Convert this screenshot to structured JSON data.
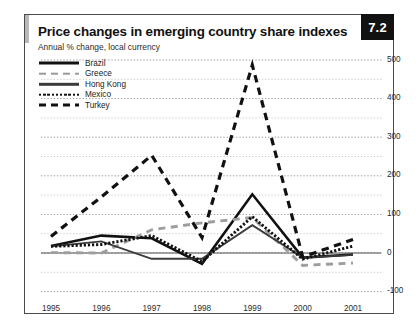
{
  "figure": {
    "number": "7.2",
    "title": "Price changes in emerging country share indexes",
    "subtitle": "Annual % change, local currency"
  },
  "chart_data": {
    "type": "line",
    "title": "Price changes in emerging country share indexes",
    "subtitle": "Annual % change, local currency",
    "xlabel": "",
    "ylabel": "",
    "x": [
      "1995",
      "1996",
      "1997",
      "1998",
      "1999",
      "2000",
      "2001"
    ],
    "categories": [
      "1995",
      "1996",
      "1997",
      "1998",
      "1999",
      "2000",
      "2001"
    ],
    "ylim": [
      -100,
      500
    ],
    "yticks": [
      -100,
      0,
      100,
      200,
      300,
      400,
      500
    ],
    "ytick_labels": [
      "-100",
      "0",
      "100",
      "200",
      "300",
      "400",
      "500"
    ],
    "minor_gridline_step": 50,
    "grid": true,
    "legend_position": "top-left",
    "series": [
      {
        "name": "Brazil",
        "style": "solid-thick",
        "color": "#111111",
        "values": [
          18,
          45,
          38,
          -28,
          152,
          -12,
          -4
        ]
      },
      {
        "name": "Greece",
        "style": "dashed",
        "color": "#9a9a9a",
        "values": [
          1,
          0,
          60,
          78,
          92,
          -32,
          -26
        ]
      },
      {
        "name": "Hong Kong",
        "style": "solid-thin",
        "color": "#3b3b3b",
        "values": [
          17,
          30,
          -15,
          -15,
          72,
          -12,
          -5
        ]
      },
      {
        "name": "Mexico",
        "style": "dotted",
        "color": "#111111",
        "values": [
          17,
          22,
          45,
          -22,
          94,
          -16,
          18
        ]
      },
      {
        "name": "Turkey",
        "style": "dashed-bold",
        "color": "#111111",
        "values": [
          43,
          145,
          253,
          40,
          487,
          -10,
          35
        ]
      }
    ]
  }
}
